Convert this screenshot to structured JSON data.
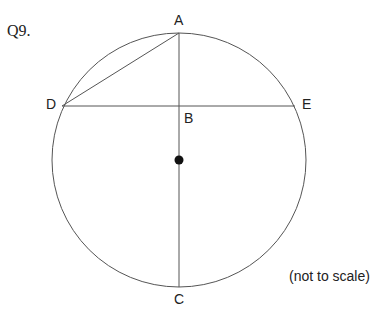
{
  "question_label": "Q9.",
  "note": "(not to scale)",
  "points": {
    "A": "A",
    "B": "B",
    "C": "C",
    "D": "D",
    "E": "E"
  },
  "geometry": {
    "circle": {
      "cx": 179,
      "cy": 160,
      "r": 127
    },
    "center_dot": {
      "x": 179,
      "y": 160
    },
    "A": {
      "x": 179,
      "y": 33
    },
    "B": {
      "x": 179,
      "y": 106
    },
    "C": {
      "x": 179,
      "y": 287
    },
    "D": {
      "x": 62,
      "y": 106
    },
    "E": {
      "x": 295,
      "y": 106
    },
    "segments": [
      "AC",
      "DE",
      "AD"
    ]
  },
  "colors": {
    "stroke": "#555555",
    "dot": "#111111"
  }
}
